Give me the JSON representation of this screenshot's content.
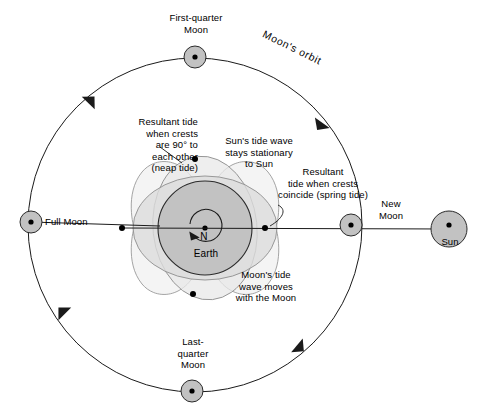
{
  "diagram": {
    "colors": {
      "background": "#ffffff",
      "stroke": "#1a1a1a",
      "earth_fill": "#c2c2c2",
      "moon_fill": "#c2c2c2",
      "sun_fill": "#c2c2c2",
      "sun_tide_fill": "#d9d9d9",
      "moon_tide_fill": "#e6e6e6",
      "resultant_fill": "#f0f0f0"
    }
  },
  "bodies": {
    "earth": {
      "label": "Earth",
      "pole_label": "N",
      "cx": 205,
      "cy": 228,
      "r": 47
    },
    "sun": {
      "label": "Sun",
      "cx": 449,
      "cy": 229,
      "r": 18
    },
    "moons": [
      {
        "name": "first-quarter-moon",
        "label": "First-quarter\nMoon",
        "cx": 195,
        "cy": 57,
        "r": 11
      },
      {
        "name": "full-moon",
        "label": "Full Moon",
        "cx": 31,
        "cy": 222,
        "r": 11
      },
      {
        "name": "last-quarter-moon",
        "label": "Last-\nquarter\nMoon",
        "cx": 192,
        "cy": 391,
        "r": 11
      },
      {
        "name": "new-moon",
        "label": "New\nMoon",
        "cx": 351,
        "cy": 225,
        "r": 11
      }
    ]
  },
  "orbit": {
    "label": "Moon's orbit",
    "cx": 195,
    "cy": 225,
    "r": 167,
    "direction": "counterclockwise",
    "arrow_count": 4
  },
  "annotations": {
    "neap_tide": "Resultant tide\nwhen crests\nare 90° to\neach other\n(neap tide)",
    "sun_tide": "Sun's tide wave\nstays stationary\nto Sun",
    "spring_tide": "Resultant\ntide when crests\ncoincide (spring tide)",
    "moon_tide": "Moon's tide\nwave moves\nwith the Moon"
  }
}
